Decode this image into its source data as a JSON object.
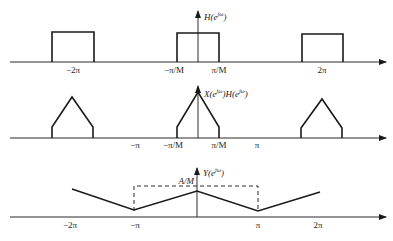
{
  "panels": [
    {
      "id": "H",
      "ylabel_main": "H(e",
      "ylabel_sup": "jω",
      "ylabel_close": ")",
      "ticks": [
        {
          "label": "−2π",
          "x": 73
        },
        {
          "label": "−π/M",
          "x": 174
        },
        {
          "label": "π/M",
          "x": 219
        },
        {
          "label": "2π",
          "x": 322
        }
      ],
      "shape": "rectangles",
      "description": "Ideal lowpass filter, passband −π/M to π/M, periodic with period 2π"
    },
    {
      "id": "XH",
      "ylabel_main": "X(e",
      "ylabel_sup": "jω",
      "ylabel_mid": ")H(e",
      "ylabel_sup2": "jω",
      "ylabel_close": ")",
      "ticks": [
        {
          "label": "−π",
          "x": 135
        },
        {
          "label": "−π/M",
          "x": 173
        },
        {
          "label": "π/M",
          "x": 219
        },
        {
          "label": "π",
          "x": 257
        }
      ],
      "shape": "truncated-triangles",
      "description": "Filtered spectrum, triangular spectrum truncated to |ω|<π/M, periodic with 2π"
    },
    {
      "id": "Y",
      "ylabel_main": "Y(e",
      "ylabel_sup": "jω",
      "ylabel_close": ")",
      "level_label": "A/M",
      "ticks": [
        {
          "label": "−2π",
          "x": 70
        },
        {
          "label": "−π",
          "x": 135
        },
        {
          "label": "π",
          "x": 258
        },
        {
          "label": "2π",
          "x": 318
        }
      ],
      "shape": "zigzag",
      "description": "Downsampled output spectrum with peak A/M at ω=0, minima at ±π, dashed box marking A/M level"
    }
  ]
}
